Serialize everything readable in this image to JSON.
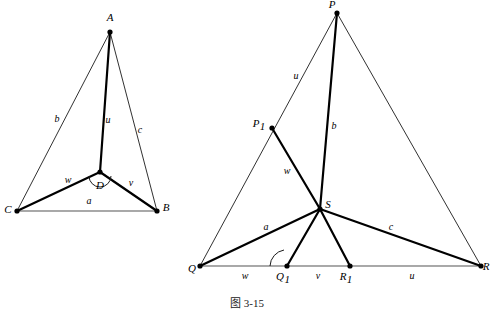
{
  "caption": "图 3-15",
  "figures": {
    "left": {
      "name": "triangle-ABC-with-interior-point-D",
      "vertices": [
        {
          "id": "A",
          "label": "A",
          "x": 110,
          "y": 32,
          "label_x": 110,
          "label_y": 21
        },
        {
          "id": "B",
          "label": "B",
          "x": 157,
          "y": 211,
          "label_x": 166,
          "label_y": 211
        },
        {
          "id": "C",
          "label": "C",
          "x": 17,
          "y": 211,
          "label_x": 8,
          "label_y": 213
        },
        {
          "id": "D",
          "label": "D",
          "x": 100,
          "y": 172,
          "label_x": 100,
          "label_y": 189
        }
      ],
      "edges": [
        {
          "from": "A",
          "to": "C",
          "label": "b",
          "weight": "thin",
          "label_x": 57,
          "label_y": 122
        },
        {
          "from": "A",
          "to": "B",
          "label": "c",
          "weight": "thin",
          "label_x": 140,
          "label_y": 133
        },
        {
          "from": "C",
          "to": "B",
          "label": "a",
          "weight": "base",
          "label_x": 89,
          "label_y": 204
        },
        {
          "from": "A",
          "to": "D",
          "label": "u",
          "weight": "thick",
          "label_x": 108,
          "label_y": 123
        },
        {
          "from": "D",
          "to": "C",
          "label": "w",
          "weight": "thick",
          "label_x": 68,
          "label_y": 183
        },
        {
          "from": "D",
          "to": "B",
          "label": "v",
          "weight": "thick",
          "label_x": 131,
          "label_y": 186
        }
      ],
      "angle_arc": {
        "name": "angle-arc-at-D",
        "cx": 100,
        "cy": 172,
        "r": 11
      }
    },
    "right": {
      "name": "triangle-PQR-with-interior-point-S",
      "vertices": [
        {
          "id": "P",
          "label": "P",
          "sub": "",
          "x": 337,
          "y": 13,
          "label_x": 332,
          "label_y": 8
        },
        {
          "id": "Q",
          "label": "Q",
          "sub": "",
          "x": 200,
          "y": 266,
          "label_x": 192,
          "label_y": 272
        },
        {
          "id": "R",
          "label": "R",
          "sub": "",
          "x": 481,
          "y": 266,
          "label_x": 486,
          "label_y": 270
        },
        {
          "id": "S",
          "label": "S",
          "sub": "",
          "x": 320,
          "y": 209,
          "label_x": 328,
          "label_y": 208
        },
        {
          "id": "P1",
          "label": "P",
          "sub": "1",
          "x": 272,
          "y": 128,
          "label_x": 259,
          "label_y": 127
        },
        {
          "id": "Q1",
          "label": "Q",
          "sub": "1",
          "x": 287,
          "y": 266,
          "label_x": 283,
          "label_y": 280
        },
        {
          "id": "R1",
          "label": "R",
          "sub": "1",
          "x": 350,
          "y": 266,
          "label_x": 346,
          "label_y": 280
        }
      ],
      "edges": [
        {
          "from": "P",
          "to": "Q",
          "label": "u",
          "weight": "thin",
          "label_x": 296,
          "label_y": 79
        },
        {
          "from": "P",
          "to": "R",
          "label": "",
          "weight": "thin",
          "label_x": 0,
          "label_y": 0
        },
        {
          "from": "Q",
          "to": "R",
          "label": "",
          "weight": "base",
          "label_x": 0,
          "label_y": 0
        },
        {
          "from": "P",
          "to": "S",
          "label": "b",
          "weight": "thick",
          "label_x": 334,
          "label_y": 129
        },
        {
          "from": "P1",
          "to": "S",
          "label": "w",
          "weight": "thick",
          "label_x": 287,
          "label_y": 174
        },
        {
          "from": "Q",
          "to": "S",
          "label": "a",
          "weight": "thick",
          "label_x": 266,
          "label_y": 230
        },
        {
          "from": "S",
          "to": "R",
          "label": "c",
          "weight": "thick",
          "label_x": 391,
          "label_y": 230
        },
        {
          "from": "S",
          "to": "Q1",
          "label": "",
          "weight": "thick",
          "label_x": 0,
          "label_y": 0
        },
        {
          "from": "S",
          "to": "R1",
          "label": "",
          "weight": "thick",
          "label_x": 0,
          "label_y": 0
        }
      ],
      "base_segment_labels": [
        {
          "name": "segment-label-w",
          "label": "w",
          "x": 245,
          "y": 279
        },
        {
          "name": "segment-label-v",
          "label": "v",
          "x": 318,
          "y": 279
        },
        {
          "name": "segment-label-u",
          "label": "u",
          "x": 412,
          "y": 279
        }
      ],
      "angle_arc": {
        "name": "angle-arc-at-Q1",
        "cx": 287,
        "cy": 266,
        "r": 17
      }
    }
  }
}
